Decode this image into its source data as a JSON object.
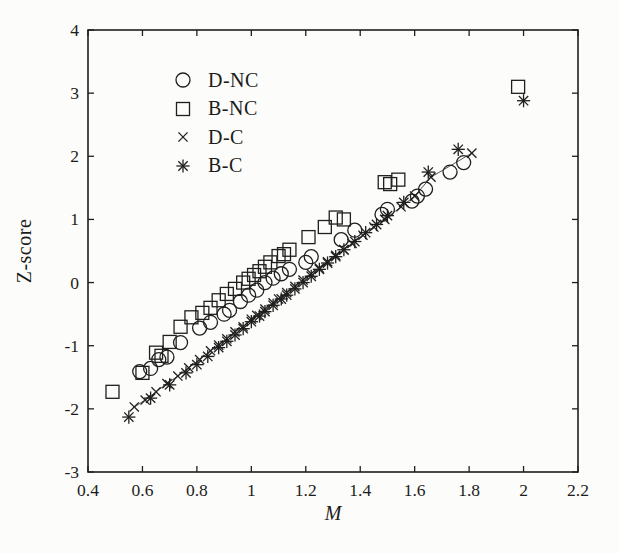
{
  "figure": {
    "background": "#fcfcfa",
    "ink_color": "#1f1f1f"
  },
  "chart_data": {
    "type": "scatter",
    "title": "",
    "xlabel": "M",
    "ylabel": "Z-score",
    "xlim": [
      0.4,
      2.2
    ],
    "ylim": [
      -3,
      4
    ],
    "xticks": [
      0.4,
      0.6,
      0.8,
      1,
      1.2,
      1.4,
      1.6,
      1.8,
      2,
      2.2
    ],
    "xtick_labels": [
      "0.4",
      "0.6",
      "0.8",
      "1",
      "1.2",
      "1.4",
      "1.6",
      "1.8",
      "2",
      "2.2"
    ],
    "yticks": [
      -3,
      -2,
      -1,
      0,
      1,
      2,
      3,
      4
    ],
    "ytick_labels": [
      "-3",
      "-2",
      "-1",
      "0",
      "1",
      "2",
      "3",
      "4"
    ],
    "grid": false,
    "legend_position": "upper-left-inside",
    "marker_color": "#1f1f1f",
    "series": [
      {
        "name": "D-NC",
        "marker": "circle",
        "connected": false,
        "points": [
          [
            0.59,
            -1.41
          ],
          [
            0.63,
            -1.36
          ],
          [
            0.66,
            -1.22
          ],
          [
            0.69,
            -1.18
          ],
          [
            0.74,
            -0.95
          ],
          [
            0.81,
            -0.72
          ],
          [
            0.85,
            -0.63
          ],
          [
            0.9,
            -0.5
          ],
          [
            0.92,
            -0.44
          ],
          [
            0.96,
            -0.3
          ],
          [
            0.99,
            -0.2
          ],
          [
            1.02,
            -0.12
          ],
          [
            1.05,
            0.0
          ],
          [
            1.08,
            0.07
          ],
          [
            1.11,
            0.14
          ],
          [
            1.14,
            0.21
          ],
          [
            1.2,
            0.32
          ],
          [
            1.22,
            0.41
          ],
          [
            1.33,
            0.68
          ],
          [
            1.38,
            0.83
          ],
          [
            1.48,
            1.08
          ],
          [
            1.5,
            1.16
          ],
          [
            1.59,
            1.29
          ],
          [
            1.61,
            1.37
          ],
          [
            1.64,
            1.48
          ],
          [
            1.73,
            1.75
          ],
          [
            1.78,
            1.9
          ]
        ]
      },
      {
        "name": "B-NC",
        "marker": "square",
        "connected": false,
        "points": [
          [
            0.49,
            -1.73
          ],
          [
            0.6,
            -1.43
          ],
          [
            0.65,
            -1.11
          ],
          [
            0.67,
            -1.16
          ],
          [
            0.7,
            -0.94
          ],
          [
            0.74,
            -0.7
          ],
          [
            0.78,
            -0.55
          ],
          [
            0.82,
            -0.48
          ],
          [
            0.85,
            -0.4
          ],
          [
            0.88,
            -0.28
          ],
          [
            0.91,
            -0.18
          ],
          [
            0.94,
            -0.1
          ],
          [
            0.97,
            0.0
          ],
          [
            0.99,
            0.06
          ],
          [
            1.01,
            0.12
          ],
          [
            1.03,
            0.18
          ],
          [
            1.05,
            0.25
          ],
          [
            1.07,
            0.32
          ],
          [
            1.1,
            0.42
          ],
          [
            1.12,
            0.45
          ],
          [
            1.14,
            0.52
          ],
          [
            1.21,
            0.72
          ],
          [
            1.27,
            0.88
          ],
          [
            1.31,
            1.03
          ],
          [
            1.34,
            1.0
          ],
          [
            1.49,
            1.59
          ],
          [
            1.51,
            1.56
          ],
          [
            1.54,
            1.63
          ],
          [
            1.98,
            3.1
          ]
        ]
      },
      {
        "name": "D-C",
        "marker": "cross",
        "connected": true,
        "points": [
          [
            0.57,
            -1.97
          ],
          [
            0.61,
            -1.86
          ],
          [
            0.65,
            -1.73
          ],
          [
            0.69,
            -1.6
          ],
          [
            0.73,
            -1.48
          ],
          [
            0.77,
            -1.35
          ],
          [
            0.81,
            -1.22
          ],
          [
            0.85,
            -1.08
          ],
          [
            0.88,
            -0.99
          ],
          [
            0.91,
            -0.89
          ],
          [
            0.94,
            -0.78
          ],
          [
            0.97,
            -0.7
          ],
          [
            1.0,
            -0.58
          ],
          [
            1.02,
            -0.52
          ],
          [
            1.05,
            -0.42
          ],
          [
            1.08,
            -0.32
          ],
          [
            1.1,
            -0.26
          ],
          [
            1.13,
            -0.16
          ],
          [
            1.16,
            -0.06
          ],
          [
            1.19,
            0.04
          ],
          [
            1.22,
            0.14
          ],
          [
            1.25,
            0.23
          ],
          [
            1.28,
            0.33
          ],
          [
            1.31,
            0.43
          ],
          [
            1.34,
            0.52
          ],
          [
            1.37,
            0.62
          ],
          [
            1.41,
            0.75
          ],
          [
            1.45,
            0.88
          ],
          [
            1.49,
            1.0
          ],
          [
            1.55,
            1.2
          ],
          [
            1.6,
            1.37
          ],
          [
            1.66,
            1.67
          ],
          [
            1.81,
            2.05
          ]
        ]
      },
      {
        "name": "B-C",
        "marker": "asterisk",
        "connected": false,
        "points": [
          [
            0.55,
            -2.13
          ],
          [
            0.63,
            -1.83
          ],
          [
            0.7,
            -1.62
          ],
          [
            0.76,
            -1.43
          ],
          [
            0.8,
            -1.3
          ],
          [
            0.84,
            -1.17
          ],
          [
            0.88,
            -1.03
          ],
          [
            0.91,
            -0.93
          ],
          [
            0.94,
            -0.83
          ],
          [
            0.97,
            -0.73
          ],
          [
            1.0,
            -0.62
          ],
          [
            1.03,
            -0.53
          ],
          [
            1.05,
            -0.46
          ],
          [
            1.08,
            -0.36
          ],
          [
            1.11,
            -0.26
          ],
          [
            1.13,
            -0.2
          ],
          [
            1.16,
            -0.1
          ],
          [
            1.19,
            0.0
          ],
          [
            1.22,
            0.1
          ],
          [
            1.25,
            0.21
          ],
          [
            1.28,
            0.31
          ],
          [
            1.31,
            0.41
          ],
          [
            1.34,
            0.52
          ],
          [
            1.38,
            0.65
          ],
          [
            1.42,
            0.79
          ],
          [
            1.46,
            0.92
          ],
          [
            1.5,
            1.06
          ],
          [
            1.56,
            1.27
          ],
          [
            1.65,
            1.75
          ],
          [
            1.76,
            2.11
          ],
          [
            2.0,
            2.88
          ]
        ]
      }
    ]
  }
}
